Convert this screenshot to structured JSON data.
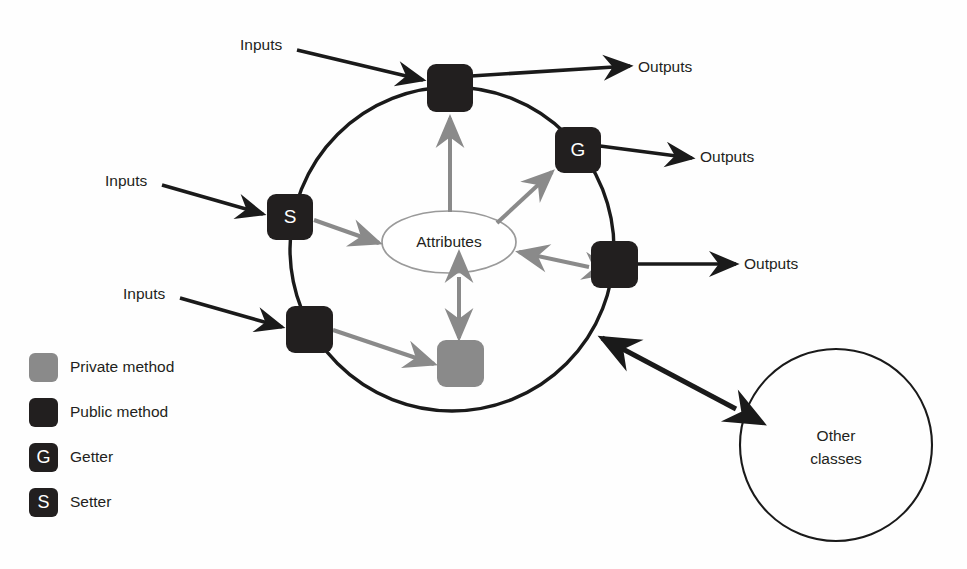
{
  "colors": {
    "public_method": "#221f1f",
    "private_method": "#8a8a8a",
    "stroke_dark": "#1a1a1a",
    "stroke_gray": "#8a8a8a",
    "ellipse_stroke": "#9a9a9a",
    "text": "#231f20",
    "background": "#fefefe"
  },
  "diagram": {
    "class_boundary": {
      "label": "",
      "cx": 452,
      "cy": 249,
      "r": 162
    },
    "attributes_node": {
      "label": "Attributes",
      "cx": 449,
      "cy": 242,
      "rx": 67,
      "ry": 31
    },
    "other_classes_node": {
      "line1": "Other",
      "line2": "classes",
      "cx": 836,
      "cy": 445,
      "r": 96
    },
    "nodes": [
      {
        "id": "public-top",
        "kind": "public-method",
        "glyph": "",
        "x": 427,
        "y": 64,
        "w": 46,
        "h": 48
      },
      {
        "id": "getter-right",
        "kind": "getter",
        "glyph": "G",
        "x": 555,
        "y": 127,
        "w": 46,
        "h": 46
      },
      {
        "id": "setter-left",
        "kind": "setter",
        "glyph": "S",
        "x": 267,
        "y": 194,
        "w": 46,
        "h": 46
      },
      {
        "id": "public-right",
        "kind": "public-method",
        "glyph": "",
        "x": 591,
        "y": 241,
        "w": 47,
        "h": 47
      },
      {
        "id": "public-bottom-left",
        "kind": "public-method",
        "glyph": "",
        "x": 286,
        "y": 306,
        "w": 47,
        "h": 47
      },
      {
        "id": "private-bottom",
        "kind": "private-method",
        "glyph": "",
        "x": 437,
        "y": 340,
        "w": 47,
        "h": 47
      }
    ],
    "inputs": [
      {
        "label": "Inputs",
        "text_x": 240,
        "text_y": 45,
        "from_x": 297,
        "from_y": 50,
        "to_x": 424,
        "to_y": 79
      },
      {
        "label": "Inputs",
        "text_x": 105,
        "text_y": 181,
        "from_x": 162,
        "from_y": 185,
        "to_x": 264,
        "to_y": 214
      },
      {
        "label": "Inputs",
        "text_x": 123,
        "text_y": 294,
        "from_x": 180,
        "from_y": 298,
        "to_x": 283,
        "to_y": 326
      }
    ],
    "outputs": [
      {
        "label": "Outputs",
        "text_x": 638,
        "text_y": 68,
        "from_x": 472,
        "from_y": 76,
        "to_x": 631,
        "to_y": 66
      },
      {
        "label": "Outputs",
        "text_x": 700,
        "text_y": 158,
        "from_x": 601,
        "from_y": 146,
        "to_x": 693,
        "to_y": 158
      },
      {
        "label": "Outputs",
        "text_x": 744,
        "text_y": 264,
        "from_x": 639,
        "from_y": 264,
        "to_x": 737,
        "to_y": 264
      }
    ],
    "internal_edges": [
      {
        "id": "public-top-to-attributes",
        "style": "gray",
        "direction": "up",
        "from_x": 450,
        "from_y": 212,
        "to_x": 450,
        "to_y": 116
      },
      {
        "id": "attributes-to-getter",
        "style": "gray",
        "direction": "to-node",
        "from_x": 497,
        "from_y": 222,
        "to_x": 551,
        "to_y": 171
      },
      {
        "id": "setter-to-attributes",
        "style": "gray",
        "direction": "to-ellipse",
        "from_x": 315,
        "from_y": 221,
        "to_x": 379,
        "to_y": 243
      },
      {
        "id": "public-right-to-attributes",
        "style": "gray",
        "direction": "both",
        "from_x": 588,
        "from_y": 267,
        "to_x": 518,
        "to_y": 252
      },
      {
        "id": "public-bl-to-private",
        "style": "gray",
        "direction": "to-node",
        "from_x": 334,
        "from_y": 330,
        "to_x": 434,
        "to_y": 364
      },
      {
        "id": "attributes-to-private",
        "style": "gray",
        "direction": "both",
        "from_x": 459,
        "from_y": 276,
        "to_x": 459,
        "to_y": 337
      }
    ],
    "external_edge": {
      "id": "class-to-other-classes",
      "style": "dark",
      "direction": "both",
      "from_x": 738,
      "from_y": 410,
      "to_x": 600,
      "to_y": 336
    }
  },
  "legend": {
    "items": [
      {
        "label": "Private method",
        "kind": "private-method",
        "glyph": "",
        "x": 29,
        "y": 353,
        "size": 29
      },
      {
        "label": "Public method",
        "kind": "public-method",
        "glyph": "",
        "x": 29,
        "y": 398,
        "size": 29
      },
      {
        "label": "Getter",
        "kind": "getter",
        "glyph": "G",
        "x": 29,
        "y": 443,
        "size": 29
      },
      {
        "label": "Setter",
        "kind": "setter",
        "glyph": "S",
        "x": 29,
        "y": 488,
        "size": 29
      }
    ],
    "label_x": 70
  }
}
